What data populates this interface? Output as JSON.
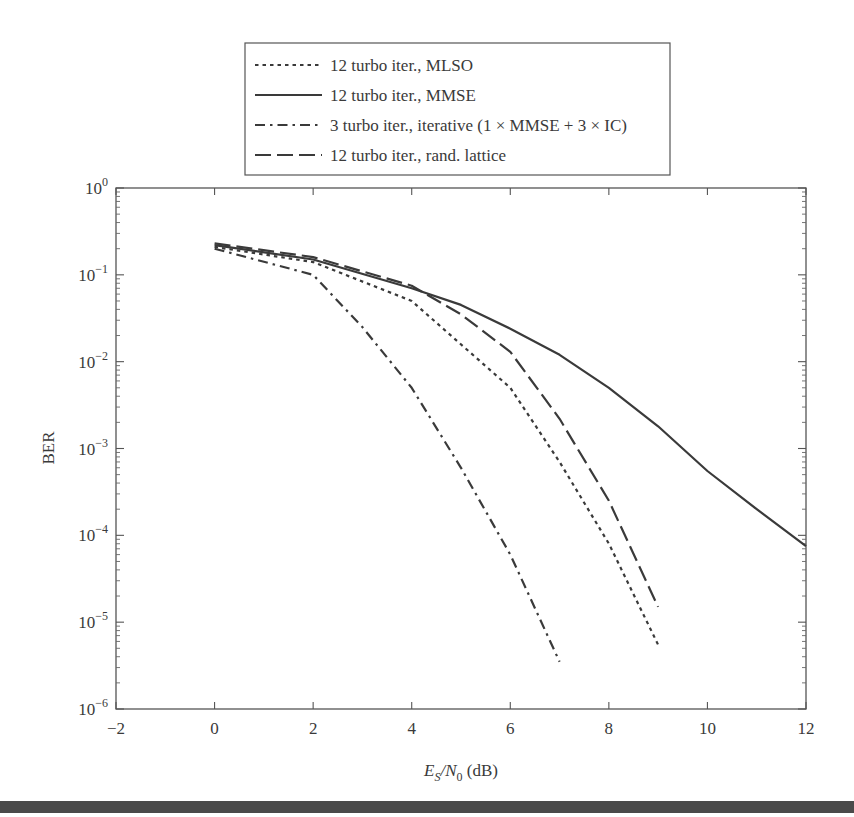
{
  "chart_data": {
    "type": "line",
    "title": "",
    "xlabel": "E_S/N_0 (dB)",
    "ylabel": "BER",
    "xlim": [
      -2,
      12
    ],
    "ylim": [
      1e-06,
      1
    ],
    "yscale": "log",
    "grid": false,
    "legend_position": "top-center-outside",
    "x_ticks": [
      -2,
      0,
      2,
      4,
      6,
      8,
      10,
      12
    ],
    "x_tick_labels": [
      "−2",
      "0",
      "2",
      "4",
      "6",
      "8",
      "10",
      "12"
    ],
    "y_ticks": [
      1,
      0.1,
      0.01,
      0.001,
      0.0001,
      1e-05,
      1e-06
    ],
    "y_tick_exponents": [
      "0",
      "−1",
      "−2",
      "−3",
      "−4",
      "−5",
      "−6"
    ],
    "series": [
      {
        "name": "12 turbo iter., MLSO",
        "style": "dotted",
        "x": [
          0,
          2,
          4,
          6,
          7,
          8,
          9
        ],
        "values": [
          0.21,
          0.14,
          0.05,
          0.005,
          0.0007,
          8e-05,
          5.5e-06
        ]
      },
      {
        "name": "12 turbo iter., MMSE",
        "style": "solid",
        "x": [
          0,
          2,
          4,
          5,
          6,
          7,
          8,
          9,
          10,
          11,
          12
        ],
        "values": [
          0.22,
          0.15,
          0.07,
          0.045,
          0.024,
          0.012,
          0.005,
          0.0018,
          0.00055,
          0.0002,
          7.5e-05
        ]
      },
      {
        "name": "3 turbo iter., iterative (1 × MMSE + 3 × IC)",
        "style": "dashdot",
        "x": [
          0,
          2,
          3,
          4,
          5,
          6,
          7
        ],
        "values": [
          0.2,
          0.1,
          0.025,
          0.005,
          0.0006,
          6e-05,
          3.5e-06
        ]
      },
      {
        "name": "12 turbo iter., rand. lattice",
        "style": "dashed",
        "x": [
          0,
          2,
          4,
          5,
          6,
          7,
          8,
          9
        ],
        "values": [
          0.23,
          0.16,
          0.075,
          0.035,
          0.013,
          0.0022,
          0.00025,
          1.5e-05
        ]
      }
    ]
  },
  "legend": {
    "items": [
      {
        "label": "12 turbo iter., MLSO",
        "style": "dotted"
      },
      {
        "label": "12 turbo iter., MMSE",
        "style": "solid"
      },
      {
        "label": "3 turbo iter., iterative (1 × MMSE + 3 × IC)",
        "style": "dashdot"
      },
      {
        "label": "12 turbo iter., rand. lattice",
        "style": "dashed"
      }
    ]
  },
  "axes": {
    "ylabel": "BER",
    "xlabel_main_E": "E",
    "xlabel_sub_S": "S",
    "xlabel_slash_N": "/N",
    "xlabel_sub_0": "0",
    "xlabel_unit": " (dB)",
    "y_base": "10"
  },
  "colors": {
    "line": "#3a3a3a",
    "axis": "#555555",
    "bottom_rule": "#4a4a4a"
  }
}
